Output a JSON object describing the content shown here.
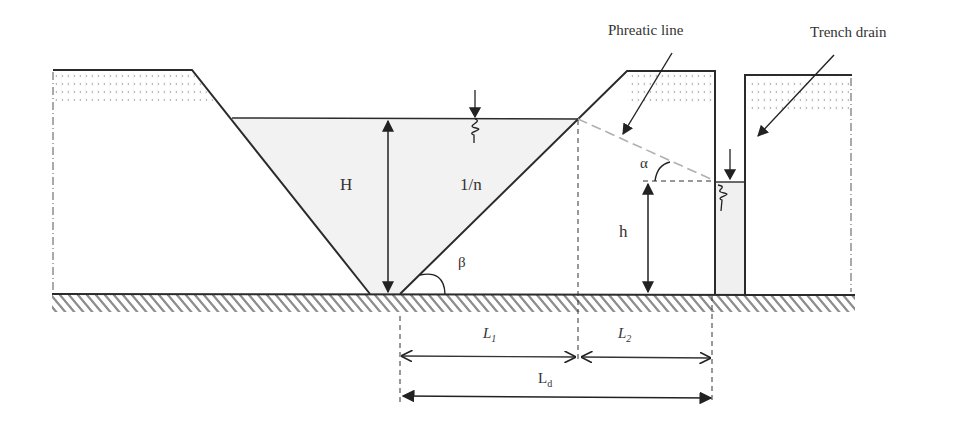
{
  "diagram": {
    "type": "cross-section",
    "labels": {
      "phreatic_line": "Phreatic line",
      "trench_drain": "Trench drain",
      "H": "H",
      "slope": "1/n",
      "beta": "β",
      "alpha": "α",
      "h": "h",
      "L1": "L",
      "L1_sub": "1",
      "L2": "L",
      "L2_sub": "2",
      "Ld": "L",
      "Ld_sub": "d"
    },
    "colors": {
      "line": "#2b2b2b",
      "water_fill": "#f1f1f1",
      "hatch": "#8a8a8a",
      "phreatic": "#b5b5b5",
      "stipple": "#9a9a9a"
    }
  }
}
